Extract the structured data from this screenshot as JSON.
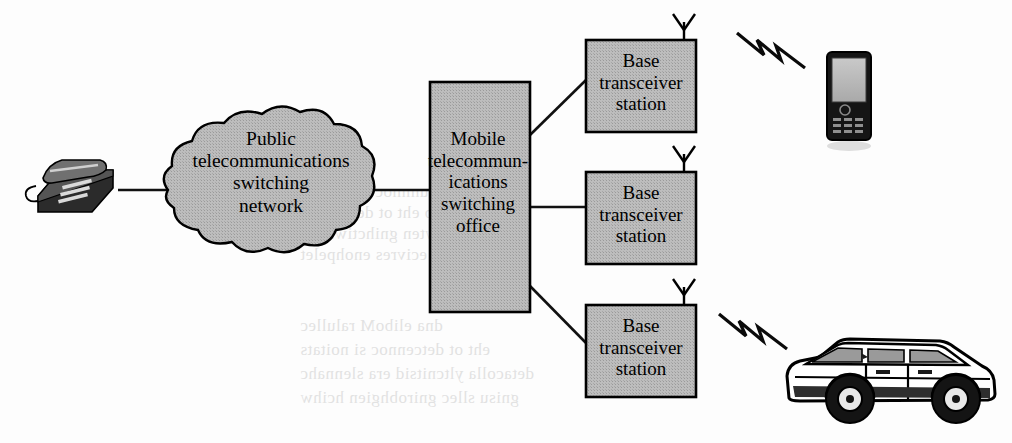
{
  "figure": {
    "kind": "network-topology-diagram",
    "background_color": "#fdfdfd",
    "fill_gray": "#b9b9b9",
    "stroke_color": "#000000"
  },
  "nodes": {
    "desk_phone": {
      "icon": "desk-telephone-icon",
      "label": ""
    },
    "cloud": {
      "icon": "network-cloud-icon",
      "label": "Public\ntelecommunications\nswitching\nnetwork"
    },
    "mtso": {
      "icon": "switching-office-box-icon",
      "label": "Mobile\ntelecommun-\nications\nswitching\noffice"
    },
    "bts1": {
      "icon": "base-station-box-icon",
      "label": "Base\ntransceiver\nstation"
    },
    "bts2": {
      "icon": "base-station-box-icon",
      "label": "Base\ntransceiver\nstation"
    },
    "bts3": {
      "icon": "base-station-box-icon",
      "label": "Base\ntransceiver\nstation"
    },
    "mobile_phone": {
      "icon": "mobile-handset-icon",
      "label": ""
    },
    "car": {
      "icon": "car-icon",
      "label": ""
    }
  },
  "antennas": [
    {
      "name": "antenna-bts1"
    },
    {
      "name": "antenna-bts2"
    },
    {
      "name": "antenna-bts3"
    }
  ],
  "links": {
    "wired": [
      {
        "name": "link-phone-to-cloud",
        "from": "desk_phone",
        "to": "cloud"
      },
      {
        "name": "link-cloud-to-mtso",
        "from": "cloud",
        "to": "mtso"
      },
      {
        "name": "link-mtso-to-bts1",
        "from": "mtso",
        "to": "bts1"
      },
      {
        "name": "link-mtso-to-bts2",
        "from": "mtso",
        "to": "bts2"
      },
      {
        "name": "link-mtso-to-bts3",
        "from": "mtso",
        "to": "bts3"
      }
    ],
    "wireless": [
      {
        "name": "radio-link-bts1-to-mobile-phone",
        "from": "bts1",
        "to": "mobile_phone"
      },
      {
        "name": "radio-link-bts3-to-car",
        "from": "bts3",
        "to": "car"
      }
    ]
  },
  "ghost_text": [
    {
      "x": 300,
      "y": 182,
      "text": "noitacinummoc elibom fo",
      "size": 17
    },
    {
      "x": 300,
      "y": 203,
      "text": "noitats esab eht ot detcennoc",
      "size": 17
    },
    {
      "x": 300,
      "y": 224,
      "text": "krowten gnihctiws eht",
      "size": 17
    },
    {
      "x": 300,
      "y": 245,
      "text": "ecivres enohpelet",
      "size": 17
    },
    {
      "x": 300,
      "y": 316,
      "text": "dna eliboM ralullec",
      "size": 17
    },
    {
      "x": 300,
      "y": 340,
      "text": "eht ot detcennoc si noitats",
      "size": 17
    },
    {
      "x": 300,
      "y": 364,
      "text": "detacolla yltcnitsid era slennahc",
      "size": 17
    },
    {
      "x": 300,
      "y": 388,
      "text": "gnisu sllec gnirobhgien hcihw",
      "size": 17
    }
  ]
}
